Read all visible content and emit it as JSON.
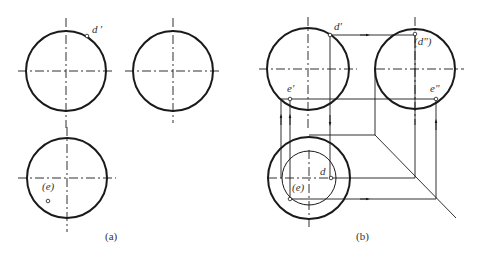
{
  "figure": {
    "panel_a": {
      "caption": "(a)",
      "labels": {
        "d_prime": "d ′",
        "e_paren": "(e)"
      }
    },
    "panel_b": {
      "caption": "(b)",
      "labels": {
        "d_prime": "d′",
        "d_double_prime": "(d″)",
        "e_prime": "e′",
        "e_double_prime": "e″",
        "d": "d",
        "e_paren": "(e)"
      }
    },
    "colors": {
      "stroke": "#1a1a1a",
      "text": "#333333",
      "background": "#ffffff"
    }
  }
}
